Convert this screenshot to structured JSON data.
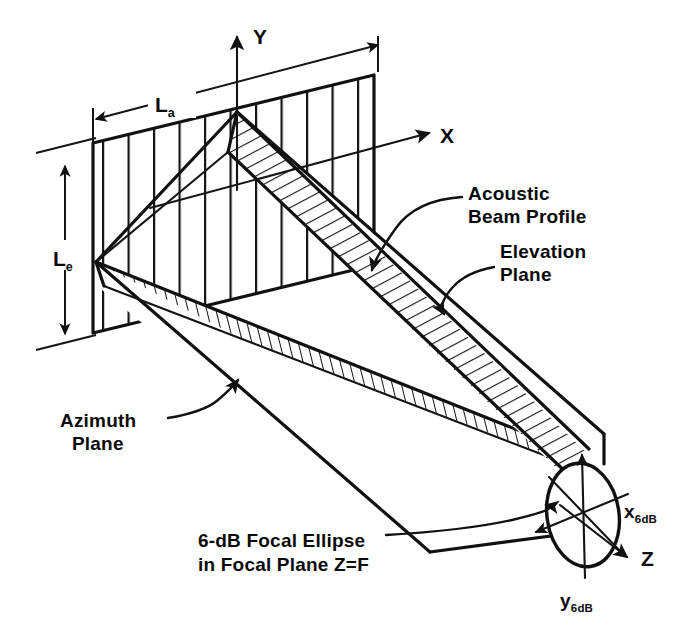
{
  "figure": {
    "background_color": "#ffffff",
    "ink_color": "#111111"
  },
  "axes": [
    {
      "id": "y-axis",
      "label": "Y",
      "label_x": 253,
      "label_y": 44
    },
    {
      "id": "x-axis",
      "label": "X",
      "label_x": 440,
      "label_y": 143
    },
    {
      "id": "z-axis",
      "label": "Z",
      "label_x": 641,
      "label_y": 566
    }
  ],
  "dimensions": [
    {
      "id": "azimuth-length",
      "symbol": "L",
      "subscript": "a",
      "label_x": 165,
      "label_y": 110,
      "meaning": "azimuth aperture length"
    },
    {
      "id": "elevation-length",
      "symbol": "L",
      "subscript": "e",
      "label_x": 38,
      "label_y": 265,
      "meaning": "elevation aperture length"
    }
  ],
  "annotations": [
    {
      "id": "acoustic-beam-profile",
      "lines": [
        "Acoustic",
        "Beam Profile"
      ],
      "x": 468,
      "y": 200,
      "anchor": "start"
    },
    {
      "id": "elevation-plane",
      "lines": [
        "Elevation",
        "Plane"
      ],
      "x": 500,
      "y": 258,
      "anchor": "start"
    },
    {
      "id": "azimuth-plane",
      "lines": [
        "Azimuth",
        "Plane"
      ],
      "x": 60,
      "y": 427,
      "anchor": "start"
    },
    {
      "id": "focal-ellipse-caption",
      "lines": [
        "6-dB Focal Ellipse",
        "in Focal Plane Z=F"
      ],
      "x": 198,
      "y": 547,
      "anchor": "start"
    }
  ],
  "ellipse_labels": [
    {
      "id": "x6db",
      "symbol": "x",
      "subscript": "6dB",
      "x": 628,
      "y": 516,
      "meaning": "6-dB beam width along x"
    },
    {
      "id": "y6db",
      "symbol": "y",
      "subscript": "6dB",
      "x": 566,
      "y": 605,
      "meaning": "6-dB beam width along y"
    }
  ],
  "focal_ellipse": {
    "center_x": 583,
    "center_y": 515,
    "radius_x": 36,
    "radius_y": 52,
    "rotation_deg": -8
  },
  "aperture": {
    "top_left_x": 93,
    "top_left_y": 143,
    "top_right_x": 374,
    "top_right_y": 75,
    "bottom_left_y": 333,
    "hatch_count": 11,
    "hatch_direction": "vertical"
  },
  "planes": {
    "elevation_hatch": "diagonal",
    "azimuth_hatch": "horizontal"
  }
}
